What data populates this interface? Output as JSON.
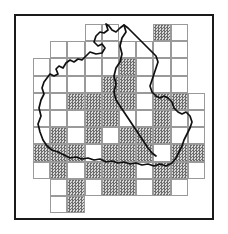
{
  "figure": {
    "frame_color": "#1a1a1a",
    "grid_line_color": "#9a9a9a",
    "shade_color": "#9e9e9e",
    "outline_color": "#101010",
    "background_color": "#ffffff"
  },
  "grid": {
    "cell_size_px": 17.2,
    "origin_x_px": 17,
    "origin_y_px": 8,
    "columns": 10,
    "rows": 11,
    "legend": {
      "shaded_label": "recorded",
      "empty_label": "not recorded"
    }
  },
  "chart_data": {
    "type": "heatmap",
    "xlabel": "",
    "ylabel": "",
    "categories": [
      "c0",
      "c1",
      "c2",
      "c3",
      "c4",
      "c5",
      "c6",
      "c7",
      "c8",
      "c9"
    ],
    "row_labels": [
      "r0",
      "r1",
      "r2",
      "r3",
      "r4",
      "r5",
      "r6",
      "r7",
      "r8",
      "r9",
      "r10"
    ],
    "values_legend": {
      "0": "cell absent",
      "1": "cell present, unshaded",
      "2": "cell present, shaded"
    },
    "matrix": [
      [
        0,
        0,
        0,
        1,
        1,
        0,
        0,
        2,
        1,
        0
      ],
      [
        0,
        1,
        1,
        1,
        1,
        1,
        1,
        1,
        1,
        0
      ],
      [
        1,
        1,
        1,
        1,
        1,
        2,
        1,
        1,
        1,
        0
      ],
      [
        1,
        1,
        1,
        1,
        2,
        2,
        1,
        1,
        1,
        0
      ],
      [
        1,
        1,
        2,
        2,
        2,
        2,
        1,
        2,
        2,
        1
      ],
      [
        1,
        1,
        1,
        2,
        2,
        1,
        1,
        2,
        1,
        1
      ],
      [
        1,
        2,
        1,
        2,
        1,
        2,
        2,
        2,
        1,
        1
      ],
      [
        2,
        2,
        2,
        1,
        2,
        2,
        2,
        1,
        2,
        2
      ],
      [
        1,
        2,
        1,
        2,
        2,
        2,
        1,
        2,
        2,
        1
      ],
      [
        0,
        1,
        2,
        1,
        2,
        2,
        1,
        2,
        1,
        0
      ],
      [
        0,
        1,
        2,
        0,
        0,
        0,
        0,
        0,
        0,
        0
      ]
    ]
  }
}
